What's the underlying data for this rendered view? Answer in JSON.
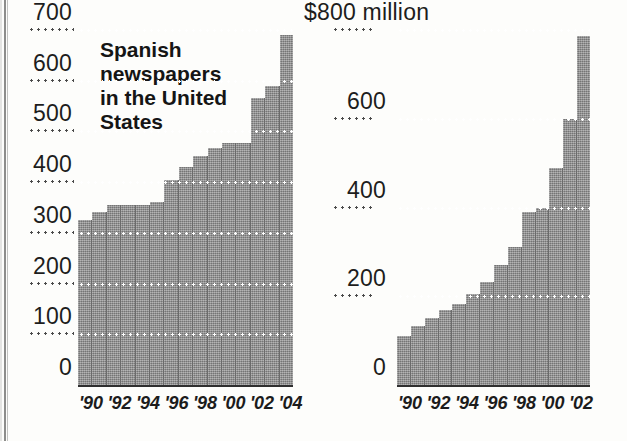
{
  "figure": {
    "width": 627,
    "height": 441,
    "background": "#fdfdfb",
    "bar_color": "#8f8f8f",
    "gridline_color": "#ffffff",
    "text_color": "#1d1d1d"
  },
  "left_panel": {
    "title": "Spanish\nnewspapers\nin the United\nStates",
    "y_ticks": [
      "700",
      "600",
      "500",
      "400",
      "300",
      "200",
      "100",
      "0"
    ],
    "x_tick_text": "'90 '92 '94 '96 '98 '00 '02 '04"
  },
  "right_panel": {
    "title": "Ad revenue",
    "y_ticks": [
      "$800 million",
      "600",
      "400",
      "200",
      "0"
    ],
    "x_tick_text": "'90 '92 '94 '96 '98 '00 '02"
  },
  "chart_data": [
    {
      "id": "spanish-newspapers",
      "type": "bar",
      "title": "Spanish newspapers in the United States",
      "xlabel": "",
      "ylabel": "",
      "ylim": [
        0,
        700
      ],
      "yticks": [
        0,
        100,
        200,
        300,
        400,
        500,
        600,
        700
      ],
      "grid": true,
      "grid_style": "dotted-white-over-bars",
      "legend": "none",
      "categories": [
        "'90",
        "'91",
        "'92",
        "'93",
        "'94",
        "'95",
        "'96",
        "'97",
        "'98",
        "'99",
        "'00",
        "'01",
        "'02",
        "'03",
        "'04"
      ],
      "tick_labels_shown": [
        "'90",
        "'92",
        "'94",
        "'96",
        "'98",
        "'00",
        "'02",
        "'04"
      ],
      "values": [
        325,
        342,
        355,
        355,
        355,
        360,
        405,
        430,
        452,
        468,
        478,
        478,
        565,
        590,
        690
      ]
    },
    {
      "id": "ad-revenue",
      "type": "bar",
      "title": "Ad revenue",
      "xlabel": "",
      "ylabel": "$ million",
      "ylim": [
        0,
        800
      ],
      "yticks": [
        0,
        200,
        400,
        600,
        800
      ],
      "ytick_labels": [
        "0",
        "200",
        "400",
        "600",
        "$800 million"
      ],
      "grid": true,
      "grid_style": "dotted-white-over-bars",
      "legend": "none",
      "categories": [
        "'90",
        "'91",
        "'92",
        "'93",
        "'94",
        "'95",
        "'96",
        "'97",
        "'98",
        "'99",
        "'00",
        "'01",
        "'02",
        "'03"
      ],
      "tick_labels_shown": [
        "'90",
        "'92",
        "'94",
        "'96",
        "'98",
        "'00",
        "'02"
      ],
      "values": [
        111,
        132,
        152,
        170,
        182,
        205,
        232,
        270,
        310,
        390,
        400,
        490,
        600,
        786
      ]
    }
  ]
}
